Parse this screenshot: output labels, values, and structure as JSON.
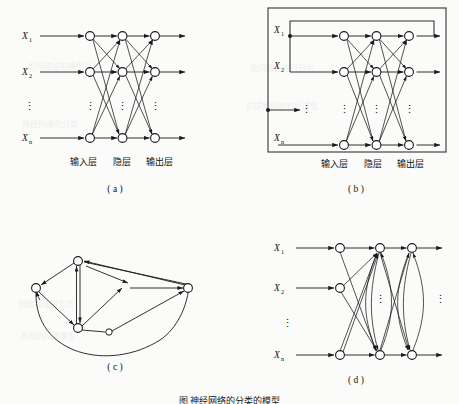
{
  "figure": {
    "caption": "图    神经网络的分类的模型",
    "background_color": "#fbfbfa",
    "ink_color": "#1a1a1a"
  },
  "labels": {
    "input_var_1": "X",
    "input_var_1_sub": "1",
    "input_var_2": "X",
    "input_var_2_sub": "2",
    "input_var_n": "X",
    "input_var_n_sub": "n",
    "vertical_dots": "⋮",
    "layer_input": "输入层",
    "layer_hidden": "隐层",
    "layer_output": "输出层"
  },
  "panels": [
    {
      "id": "a",
      "label": "( a )",
      "title": "前馈网络",
      "layer_labels": [
        "输入层",
        "隐层",
        "输出层"
      ],
      "input_labels": [
        "X1",
        "X2",
        "Xn"
      ],
      "layer_x": [
        90,
        122.5,
        155
      ],
      "row_y": [
        36,
        72,
        138
      ],
      "has_outer_box": false,
      "has_feedback_loop": false,
      "has_lateral_links": false
    },
    {
      "id": "b",
      "label": "( b )",
      "title": "带反馈的前馈网络",
      "layer_labels": [
        "输入层",
        "隐层",
        "输出层"
      ],
      "input_labels": [
        "X1",
        "X2",
        "Xn"
      ],
      "layer_x": [
        344,
        376.5,
        409
      ],
      "row_y": [
        36,
        72,
        145
      ],
      "has_outer_box": true,
      "outer_box": {
        "x": 268,
        "y": 8,
        "width": 178,
        "height": 144
      },
      "feedback_box": {
        "x": 290,
        "y": 21,
        "width": 144,
        "height": 15
      },
      "has_feedback_loop": true,
      "has_lateral_links": false
    },
    {
      "id": "c",
      "label": "( c )",
      "title": "全互连网络",
      "nodes": [
        {
          "name": "top",
          "cx": 78,
          "cy": 261,
          "r": 4.2
        },
        {
          "name": "left",
          "cx": 36,
          "cy": 288,
          "r": 4.2
        },
        {
          "name": "bottom",
          "cx": 78,
          "cy": 328,
          "r": 4.2
        },
        {
          "name": "mid",
          "cx": 109,
          "cy": 333,
          "r": 3.2
        },
        {
          "name": "right",
          "cx": 188,
          "cy": 288,
          "r": 4.2
        }
      ],
      "has_outer_box": false
    },
    {
      "id": "d",
      "label": "( d )",
      "title": "层内互连的前馈网络",
      "input_labels": [
        "X1",
        "X2",
        "Xn"
      ],
      "layer_x": [
        340,
        380,
        412
      ],
      "row_y": [
        248,
        288,
        355
      ],
      "has_outer_box": false,
      "has_lateral_links": true
    }
  ]
}
